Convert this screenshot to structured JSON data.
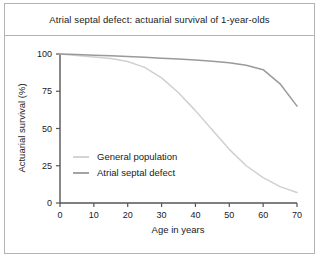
{
  "chart_data": {
    "type": "line",
    "title": "Atrial septal defect: actuarial survival of 1-year-olds",
    "xlabel": "Age in years",
    "ylabel": "Actuarial survival (%)",
    "xlim": [
      0,
      70
    ],
    "ylim": [
      0,
      100
    ],
    "xticks": [
      0,
      10,
      20,
      30,
      40,
      50,
      60,
      70
    ],
    "yticks": [
      0,
      25,
      50,
      75,
      100
    ],
    "xtick_labels": [
      "0",
      "10",
      "20",
      "30",
      "40",
      "50",
      "60",
      "70"
    ],
    "ytick_labels": [
      "0",
      "25",
      "50",
      "75",
      "100"
    ],
    "grid": false,
    "legend_position": "lower-left-inside",
    "series": [
      {
        "name": "General population",
        "color": "#d0d0d0",
        "x": [
          0,
          5,
          10,
          15,
          20,
          25,
          30,
          35,
          40,
          45,
          50,
          55,
          60,
          65,
          70
        ],
        "values": [
          100,
          99,
          98,
          97,
          95,
          91,
          84,
          74,
          62,
          49,
          36,
          25,
          17,
          11,
          7
        ]
      },
      {
        "name": "Atrial septal defect",
        "color": "#9a9a9a",
        "x": [
          0,
          5,
          10,
          15,
          20,
          25,
          30,
          35,
          40,
          45,
          50,
          55,
          60,
          65,
          70
        ],
        "values": [
          100,
          99.6,
          99.2,
          98.8,
          98.3,
          97.8,
          97.2,
          96.6,
          95.9,
          95.1,
          94.1,
          92.4,
          89.5,
          80,
          65
        ]
      }
    ]
  },
  "legend": {
    "entries": [
      {
        "label": "General population",
        "swatch": "#d0d0d0"
      },
      {
        "label": "Atrial septal defect",
        "swatch": "#9a9a9a"
      }
    ]
  }
}
